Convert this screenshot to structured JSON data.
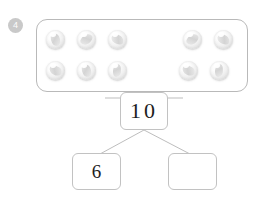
{
  "worksheet": {
    "problem_number": "4",
    "marble_frame": {
      "label": "marble-collection-frame",
      "total_marbles": 10,
      "groups": [
        {
          "name": "left-group",
          "count": 6,
          "rows": [
            {
              "marbles": [
                "marble",
                "marble",
                "marble"
              ]
            },
            {
              "marbles": [
                "marble",
                "marble",
                "marble"
              ]
            }
          ]
        },
        {
          "name": "right-group",
          "count": 4,
          "rows": [
            {
              "marbles": [
                "marble",
                "marble"
              ]
            },
            {
              "marbles": [
                "marble",
                "marble"
              ]
            }
          ]
        }
      ]
    },
    "number_bond": {
      "total_value": "10",
      "part_left_value": "6",
      "part_right_value": "",
      "connector_color": "#b5b5b5"
    },
    "colors": {
      "badge_fill": "#c9c9c9",
      "badge_text": "#fdfdfd",
      "frame_border": "#b9b9b9",
      "box_border": "#c2c2c2",
      "digit_color": "#1d1d1d",
      "page_background": "#ffffff"
    }
  }
}
